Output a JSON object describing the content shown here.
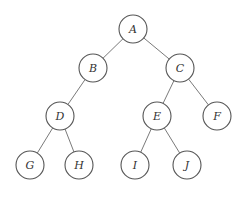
{
  "diagram": {
    "type": "binary-tree",
    "colors": {
      "node_stroke": "#555555",
      "edge": "#7a7a7a",
      "label": "#333333",
      "background": "#ffffff"
    },
    "node_radius": 14,
    "nodes": [
      {
        "id": "A",
        "label": "A",
        "x": 133,
        "y": 29
      },
      {
        "id": "B",
        "label": "B",
        "x": 93,
        "y": 68
      },
      {
        "id": "C",
        "label": "C",
        "x": 180,
        "y": 68
      },
      {
        "id": "D",
        "label": "D",
        "x": 60,
        "y": 116
      },
      {
        "id": "E",
        "label": "E",
        "x": 157,
        "y": 116
      },
      {
        "id": "F",
        "label": "F",
        "x": 217,
        "y": 116
      },
      {
        "id": "G",
        "label": "G",
        "x": 30,
        "y": 165
      },
      {
        "id": "H",
        "label": "H",
        "x": 79,
        "y": 165
      },
      {
        "id": "I",
        "label": "I",
        "x": 135,
        "y": 165
      },
      {
        "id": "J",
        "label": "J",
        "x": 187,
        "y": 165
      }
    ],
    "edges": [
      {
        "from": "A",
        "to": "B"
      },
      {
        "from": "A",
        "to": "C"
      },
      {
        "from": "B",
        "to": "D"
      },
      {
        "from": "C",
        "to": "E"
      },
      {
        "from": "C",
        "to": "F"
      },
      {
        "from": "D",
        "to": "G"
      },
      {
        "from": "D",
        "to": "H"
      },
      {
        "from": "E",
        "to": "I"
      },
      {
        "from": "E",
        "to": "J"
      }
    ]
  }
}
